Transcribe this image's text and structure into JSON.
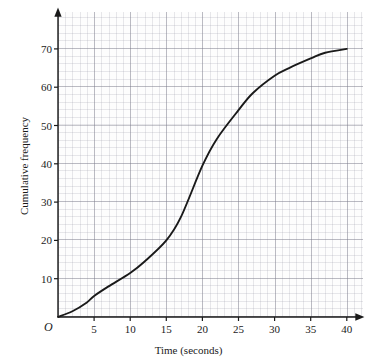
{
  "chart_data": {
    "type": "line",
    "title": "",
    "xlabel": "Time (seconds)",
    "ylabel": "Cumulative frequency",
    "xlim": [
      0,
      42
    ],
    "ylim": [
      0,
      77
    ],
    "grid": true,
    "legend": "none",
    "origin_label": "O",
    "xticks": [
      5,
      10,
      15,
      20,
      25,
      30,
      35,
      40
    ],
    "yticks": [
      10,
      20,
      30,
      40,
      50,
      60,
      70
    ],
    "xtick_labels": [
      "5",
      "10",
      "15",
      "20",
      "25",
      "30",
      "35",
      "40"
    ],
    "ytick_labels": [
      "10",
      "20",
      "30",
      "40",
      "50",
      "60",
      "70"
    ],
    "series": [
      {
        "name": "Cumulative frequency",
        "color": "#1a1a1a",
        "x": [
          0,
          2,
          4,
          5,
          7,
          10,
          12,
          15,
          17,
          20,
          22,
          25,
          27,
          30,
          32,
          35,
          37,
          40
        ],
        "values": [
          0,
          1.5,
          3.8,
          5.5,
          8.0,
          11.5,
          14.5,
          20.0,
          26.0,
          39.5,
          46.5,
          54.0,
          58.5,
          63.0,
          65.0,
          67.5,
          69.0,
          70.0
        ]
      }
    ],
    "curve_color": "#1a1a1a",
    "axis_color": "#1a1a1a",
    "grid_major_color": "#787887",
    "grid_minor_color": "#9696a5",
    "background_color": "#fdfdfd"
  },
  "axes": {
    "x_title": "Time (seconds)",
    "y_title": "Cumulative frequency",
    "origin": "O"
  }
}
